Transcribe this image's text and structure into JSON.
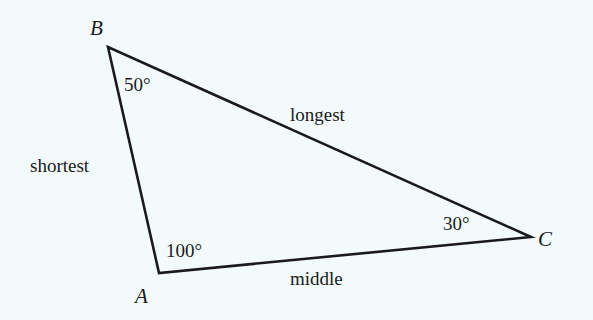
{
  "diagram": {
    "type": "triangle",
    "background": "#f2fafc",
    "stroke_color": "#1a1a1a",
    "vertices": [
      {
        "name": "B",
        "x": 108,
        "y": 47,
        "angle": "50°"
      },
      {
        "name": "A",
        "x": 159,
        "y": 273,
        "angle": "100°"
      },
      {
        "name": "C",
        "x": 531,
        "y": 237,
        "angle": "30°"
      }
    ],
    "sides": {
      "AB": "shortest",
      "BC": "longest",
      "AC": "middle"
    }
  }
}
